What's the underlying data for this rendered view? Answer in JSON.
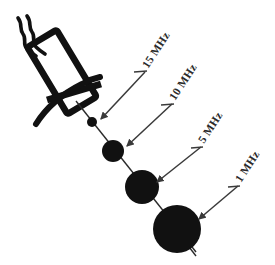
{
  "figure": {
    "background_color": "#ffffff",
    "ink_color": "#111111",
    "label_color": "#2b2b2b",
    "line_color": "#4a4a4a"
  },
  "transducer": {
    "name": "ultrasound-transducer-probe",
    "body_label": "",
    "cable_label": "",
    "face_label": ""
  },
  "labels": [
    {
      "text": "15 MHz",
      "frequency_mhz": 15
    },
    {
      "text": "10 MHz",
      "frequency_mhz": 10
    },
    {
      "text": "5 MHz",
      "frequency_mhz": 5
    },
    {
      "text": "1 MHz",
      "frequency_mhz": 1
    }
  ],
  "chart_data": {
    "type": "scatter",
    "xlabel": "",
    "ylabel": "",
    "series": [
      {
        "name": "Focal zone spot size vs frequency",
        "points": [
          {
            "label": "15 MHz",
            "frequency_mhz": 15,
            "cx": 92,
            "cy": 122,
            "r": 5
          },
          {
            "label": "10 MHz",
            "frequency_mhz": 10,
            "cx": 113,
            "cy": 151,
            "r": 11
          },
          {
            "label": "5 MHz",
            "frequency_mhz": 5,
            "cx": 142,
            "cy": 187,
            "r": 17
          },
          {
            "label": "1 MHz",
            "frequency_mhz": 1,
            "cx": 177,
            "cy": 229,
            "r": 24
          }
        ]
      }
    ],
    "annotations": [
      {
        "text": "15 MHz",
        "points_to": "15 MHz"
      },
      {
        "text": "10 MHz",
        "points_to": "10 MHz"
      },
      {
        "text": "5 MHz",
        "points_to": "5 MHz"
      },
      {
        "text": "1 MHz",
        "points_to": "1 MHz"
      }
    ],
    "grid": false,
    "legend": "none"
  }
}
